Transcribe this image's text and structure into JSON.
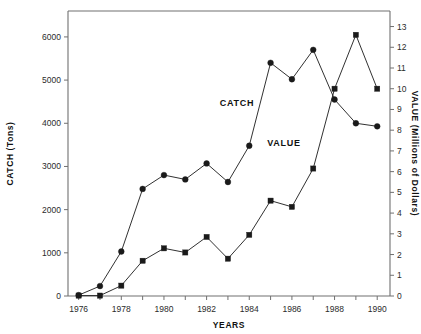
{
  "chart_data": {
    "type": "line",
    "title": "",
    "xlabel": "YEARS",
    "ylabel": "CATCH (Tons)",
    "y2label": "VALUE (Millions of Dollars)",
    "x": [
      1976,
      1977,
      1978,
      1979,
      1980,
      1981,
      1982,
      1983,
      1984,
      1985,
      1986,
      1987,
      1988,
      1989,
      1990
    ],
    "xlim": [
      1975.5,
      1990.6
    ],
    "xticks": [
      1976,
      1977,
      1978,
      1979,
      1980,
      1981,
      1982,
      1983,
      1984,
      1985,
      1986,
      1987,
      1988,
      1989,
      1990
    ],
    "xticklabels": [
      "1976",
      "",
      "1978",
      "",
      "1980",
      "",
      "1982",
      "",
      "1984",
      "",
      "1986",
      "",
      "1988",
      "",
      "1990"
    ],
    "ylim": [
      0,
      6600
    ],
    "yticks": [
      0,
      1000,
      2000,
      3000,
      4000,
      5000,
      6000
    ],
    "yticklabels": [
      "0",
      "1000",
      "2000",
      "3000",
      "4000",
      "5000",
      "6000"
    ],
    "y2lim": [
      0,
      13.75
    ],
    "y2ticks": [
      0,
      1,
      2,
      3,
      4,
      5,
      6,
      7,
      8,
      9,
      10,
      11,
      12,
      13
    ],
    "y2ticklabels": [
      "0",
      "1",
      "2",
      "3",
      "4",
      "5",
      "6",
      "7",
      "8",
      "9",
      "10",
      "11",
      "12",
      "13"
    ],
    "grid": false,
    "legend_position": "inline-annotations",
    "series": [
      {
        "name": "CATCH",
        "axis": "left",
        "marker": "circle",
        "color": "#1a1a1a",
        "annotation": "CATCH",
        "values": [
          20,
          230,
          1030,
          2480,
          2800,
          2700,
          3070,
          2640,
          3480,
          5400,
          5020,
          5700,
          4550,
          4000,
          3930
        ]
      },
      {
        "name": "VALUE",
        "axis": "right",
        "marker": "square",
        "color": "#1a1a1a",
        "annotation": "VALUE",
        "values": [
          0.02,
          0.02,
          0.5,
          1.7,
          2.3,
          2.1,
          2.85,
          1.8,
          2.95,
          4.6,
          4.3,
          6.15,
          10.0,
          12.6,
          10.0
        ]
      }
    ]
  },
  "annotations": {
    "catch_label": "CATCH",
    "value_label": "VALUE"
  },
  "axes": {
    "left_title": "CATCH (Tons)",
    "right_title": "VALUE (Millions of Dollars)",
    "bottom_title": "YEARS"
  }
}
